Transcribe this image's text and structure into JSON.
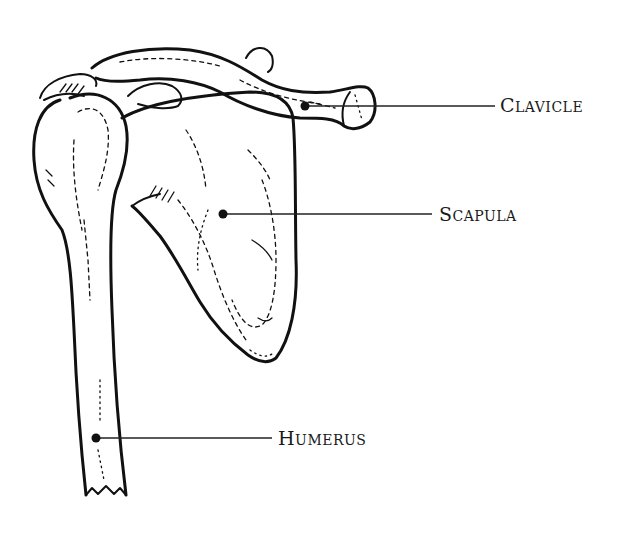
{
  "diagram": {
    "labels": [
      {
        "id": "clavicle",
        "text_first": "C",
        "text_rest": "lavicle",
        "full_text": "Clavicle",
        "dot": [
          305,
          106
        ],
        "line_end": [
          495,
          106
        ],
        "text_pos": [
          500,
          94
        ]
      },
      {
        "id": "scapula",
        "text_first": "S",
        "text_rest": "capula",
        "full_text": "Scapula",
        "dot": [
          223,
          214
        ],
        "line_end": [
          432,
          214
        ],
        "text_pos": [
          439,
          203
        ]
      },
      {
        "id": "humerus",
        "text_first": "H",
        "text_rest": "umerus",
        "full_text": "Humerus",
        "dot": [
          96,
          438
        ],
        "line_end": [
          272,
          438
        ],
        "text_pos": [
          278,
          427
        ]
      }
    ],
    "colors": {
      "ink": "#111111",
      "background": "#ffffff",
      "label_text": "#1a1a1a"
    }
  }
}
